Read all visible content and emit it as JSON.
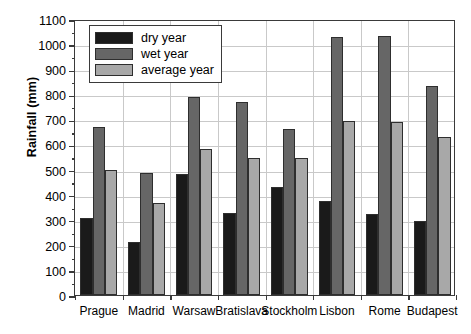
{
  "chart_data": {
    "type": "bar",
    "title": "",
    "xlabel": "",
    "ylabel": "Rainfall (mm)",
    "ylim": [
      0,
      1100
    ],
    "ytick_step": 100,
    "yminor_step": 50,
    "grid": "both",
    "legend_position": "top-left",
    "categories": [
      "Prague",
      "Madrid",
      "Warsaw",
      "Bratislava",
      "Stockholm",
      "Lisbon",
      "Rome",
      "Budapest"
    ],
    "series": [
      {
        "name": "dry year",
        "color": "#1a1a1a",
        "values": [
          305,
          213,
          483,
          328,
          430,
          375,
          322,
          295
        ]
      },
      {
        "name": "wet year",
        "color": "#666666",
        "values": [
          670,
          487,
          790,
          770,
          660,
          1027,
          1032,
          832
        ]
      },
      {
        "name": "average year",
        "color": "#a8a8a8",
        "values": [
          500,
          367,
          580,
          548,
          548,
          693,
          688,
          630
        ]
      }
    ],
    "ytick_labels": [
      "0",
      "100",
      "200",
      "300",
      "400",
      "500",
      "600",
      "700",
      "800",
      "900",
      "1000",
      "1100"
    ]
  },
  "legend": {
    "entries": [
      {
        "label": "dry year"
      },
      {
        "label": "wet year"
      },
      {
        "label": "average year"
      }
    ]
  },
  "axis": {
    "y_title": "Rainfall (mm)"
  }
}
